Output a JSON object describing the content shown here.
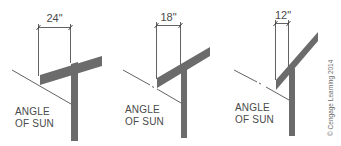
{
  "colors": {
    "structure": "#6b6b6b",
    "line": "#3a3a3a",
    "text": "#4a4a4a",
    "background": "#ffffff"
  },
  "panels": [
    {
      "overhang_label": "24\"",
      "overhang_inches": 24,
      "sun_label_line1": "ANGLE",
      "sun_label_line2": "OF SUN"
    },
    {
      "overhang_label": "18\"",
      "overhang_inches": 18,
      "sun_label_line1": "ANGLE",
      "sun_label_line2": "OF SUN"
    },
    {
      "overhang_label": "12\"",
      "overhang_inches": 12,
      "sun_label_line1": "ANGLE",
      "sun_label_line2": "OF SUN"
    }
  ],
  "credit": "© Cengage Learning 2014"
}
